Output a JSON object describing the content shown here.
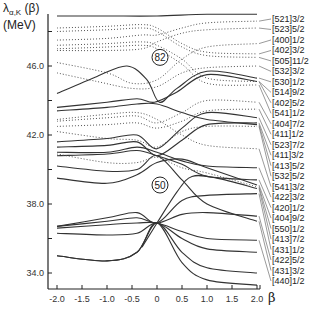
{
  "chart_data": {
    "type": "line",
    "title": "",
    "ylabel_line1_main": "λ",
    "ylabel_line1_sub": "α,K",
    "ylabel_line1_rest": " (β)",
    "ylabel_line2": "(MeV)",
    "xlabel": "β",
    "xlim": [
      -2.0,
      2.0
    ],
    "ylim": [
      33.1,
      49.0
    ],
    "x_ticks": [
      -2.0,
      -1.5,
      -1.0,
      -0.5,
      0,
      0.5,
      1.0,
      1.5,
      2.0
    ],
    "x_tick_labels": [
      "-2.0",
      "-1.5",
      "-1.0",
      "-0.5",
      "0",
      "0.5",
      "1.0",
      "1.5",
      "2.0"
    ],
    "y_ticks": [
      34.0,
      36.0,
      38.0,
      40.0,
      42.0,
      44.0,
      46.0,
      48.0
    ],
    "y_tick_labels": [
      "34.0",
      "",
      "38.0",
      "",
      "42.0",
      "",
      "46.0",
      ""
    ],
    "grid": false,
    "magic_numbers": [
      {
        "label": "82",
        "beta": 0.0,
        "energy": 46.5
      },
      {
        "label": "50",
        "beta": 0.0,
        "energy": 39.1
      }
    ],
    "state_labels": [
      "[521]3/2",
      "[523]5/2",
      "[400]1/2",
      "[402]3/2",
      "[505]11/2",
      "[532]3/2",
      "[530]1/2",
      "[514]9/2",
      "[402]5/2",
      "[541]1/2",
      "[404]7/2",
      "[411]1/2",
      "[523]7/2",
      "[411]3/2",
      "[413]5/2",
      "[532]5/2",
      "[541]3/2",
      "[422]3/2",
      "[420]1/2",
      "[404]9/2",
      "[550]1/2",
      "[413]7/2",
      "[431]1/2",
      "[422]5/2",
      "[431]3/2",
      "[440]1/2"
    ],
    "series": [
      {
        "name": "top-solid",
        "style": "solid",
        "points": [
          [
            -2,
            48.9
          ],
          [
            -1,
            48.9
          ],
          [
            0,
            48.9
          ],
          [
            1,
            49.0
          ],
          [
            2,
            49.0
          ]
        ]
      },
      {
        "name": "dot-a1",
        "style": "dotted",
        "points": [
          [
            -2,
            48.2
          ],
          [
            -1,
            48.3
          ],
          [
            -0.3,
            48.4
          ],
          [
            0,
            48.2
          ],
          [
            0.5,
            47.3
          ],
          [
            1,
            46.8
          ],
          [
            2,
            46.7
          ]
        ]
      },
      {
        "name": "dot-a2",
        "style": "dotted",
        "points": [
          [
            -2,
            48.0
          ],
          [
            -1,
            48.1
          ],
          [
            -0.3,
            48.2
          ],
          [
            0,
            48.0
          ],
          [
            0.5,
            47.1
          ],
          [
            1,
            46.6
          ],
          [
            2,
            46.5
          ]
        ]
      },
      {
        "name": "dot-a3",
        "style": "dotted",
        "points": [
          [
            -2,
            47.5
          ],
          [
            -1,
            47.6
          ],
          [
            -0.3,
            47.8
          ],
          [
            0,
            47.8
          ],
          [
            0.5,
            48.2
          ],
          [
            1,
            48.5
          ],
          [
            2,
            48.6
          ]
        ]
      },
      {
        "name": "dot-b1",
        "style": "dotted",
        "points": [
          [
            -2,
            47.2
          ],
          [
            -1,
            47.3
          ],
          [
            -0.3,
            47.4
          ],
          [
            0,
            47.2
          ],
          [
            0.5,
            46.4
          ],
          [
            1,
            45.3
          ],
          [
            2,
            45.1
          ]
        ]
      },
      {
        "name": "dot-b2",
        "style": "dotted",
        "points": [
          [
            -2,
            47.0
          ],
          [
            -1,
            47.1
          ],
          [
            -0.3,
            47.2
          ],
          [
            0,
            47.0
          ],
          [
            0.5,
            46.1
          ],
          [
            1,
            45.0
          ],
          [
            2,
            44.9
          ]
        ]
      },
      {
        "name": "dot-b3",
        "style": "dotted",
        "points": [
          [
            -2,
            46.9
          ],
          [
            -1,
            46.9
          ],
          [
            -0.3,
            47.0
          ],
          [
            0,
            47.4
          ],
          [
            0.5,
            47.9
          ],
          [
            1,
            48.1
          ],
          [
            2,
            48.2
          ]
        ]
      },
      {
        "name": "dot-c",
        "style": "dotted",
        "points": [
          [
            -2,
            46.2
          ],
          [
            -1,
            45.6
          ],
          [
            -0.5,
            45.0
          ],
          [
            0,
            45.2
          ],
          [
            0.5,
            46.4
          ],
          [
            1,
            47.1
          ],
          [
            2,
            47.3
          ]
        ]
      },
      {
        "name": "dot-d",
        "style": "dotted",
        "points": [
          [
            -2,
            45.6
          ],
          [
            -1.2,
            45.1
          ],
          [
            -0.5,
            44.7
          ],
          [
            0,
            44.8
          ],
          [
            0.5,
            45.6
          ],
          [
            1,
            45.9
          ],
          [
            2,
            46.0
          ]
        ]
      },
      {
        "name": "solid-82a",
        "style": "solid",
        "points": [
          [
            -2,
            44.4
          ],
          [
            -1.2,
            45.4
          ],
          [
            -0.6,
            46.0
          ],
          [
            -0.2,
            45.2
          ],
          [
            0.05,
            43.9
          ],
          [
            0.4,
            44.7
          ],
          [
            1,
            45.7
          ],
          [
            2,
            45.3
          ]
        ]
      },
      {
        "name": "solid-82b",
        "style": "solid",
        "points": [
          [
            -2,
            43.6
          ],
          [
            -1,
            43.9
          ],
          [
            -0.4,
            44.1
          ],
          [
            -0.05,
            43.9
          ],
          [
            0.4,
            44.5
          ],
          [
            1,
            45.5
          ],
          [
            2,
            45.1
          ]
        ]
      },
      {
        "name": "solid-82c",
        "style": "solid",
        "points": [
          [
            -2,
            43.4
          ],
          [
            -1,
            43.6
          ],
          [
            -0.4,
            43.8
          ],
          [
            0,
            43.8
          ],
          [
            0.5,
            43.3
          ],
          [
            1,
            42.9
          ],
          [
            2,
            42.6
          ]
        ]
      },
      {
        "name": "dot-e1",
        "style": "dotted",
        "points": [
          [
            -2,
            42.9
          ],
          [
            -1,
            43.2
          ],
          [
            -0.4,
            43.3
          ],
          [
            0,
            42.9
          ],
          [
            0.5,
            42.0
          ],
          [
            1,
            41.4
          ],
          [
            2,
            41.2
          ]
        ]
      },
      {
        "name": "dot-e2",
        "style": "dotted",
        "points": [
          [
            -2,
            42.8
          ],
          [
            -1,
            43.0
          ],
          [
            -0.4,
            43.1
          ],
          [
            0,
            42.7
          ],
          [
            0.5,
            43.3
          ],
          [
            1,
            44.0
          ],
          [
            2,
            43.9
          ]
        ]
      },
      {
        "name": "dot-e3",
        "style": "dotted",
        "points": [
          [
            -2,
            42.5
          ],
          [
            -1,
            42.6
          ],
          [
            -0.4,
            42.7
          ],
          [
            0,
            42.4
          ],
          [
            0.5,
            42.8
          ],
          [
            1,
            43.4
          ],
          [
            2,
            43.5
          ]
        ]
      },
      {
        "name": "dot-f",
        "style": "dotted",
        "points": [
          [
            -2,
            42.2
          ],
          [
            -1,
            41.8
          ],
          [
            -0.4,
            41.7
          ],
          [
            0,
            41.3
          ],
          [
            0.5,
            42.2
          ],
          [
            1,
            42.5
          ],
          [
            2,
            42.5
          ]
        ]
      },
      {
        "name": "solid-g1",
        "style": "solid",
        "points": [
          [
            -2,
            41.6
          ],
          [
            -1,
            41.8
          ],
          [
            -0.4,
            42.0
          ],
          [
            0,
            41.2
          ],
          [
            0.5,
            42.4
          ],
          [
            1,
            43.3
          ],
          [
            2,
            43.0
          ]
        ]
      },
      {
        "name": "solid-g2",
        "style": "solid",
        "points": [
          [
            -2,
            41.3
          ],
          [
            -1,
            41.4
          ],
          [
            -0.4,
            41.6
          ],
          [
            0,
            40.8
          ],
          [
            0.5,
            41.7
          ],
          [
            1,
            42.6
          ],
          [
            2,
            42.7
          ]
        ]
      },
      {
        "name": "solid-g3",
        "style": "solid",
        "points": [
          [
            -2,
            41.0
          ],
          [
            -1,
            41.0
          ],
          [
            -0.4,
            41.3
          ],
          [
            0,
            41.0
          ],
          [
            0.5,
            40.5
          ],
          [
            1,
            40.2
          ],
          [
            2,
            40.1
          ]
        ]
      },
      {
        "name": "solid-g4",
        "style": "solid",
        "points": [
          [
            -2,
            40.8
          ],
          [
            -1,
            40.9
          ],
          [
            -0.4,
            41.1
          ],
          [
            0,
            40.8
          ],
          [
            0.5,
            40.3
          ],
          [
            1,
            39.6
          ],
          [
            2,
            39.4
          ]
        ]
      },
      {
        "name": "dot-h",
        "style": "dotted",
        "points": [
          [
            -2,
            40.9
          ],
          [
            -1,
            40.4
          ],
          [
            -0.4,
            40.4
          ],
          [
            0,
            40.7
          ],
          [
            0.5,
            40.1
          ],
          [
            1,
            39.8
          ],
          [
            2,
            39.0
          ]
        ]
      },
      {
        "name": "solid-i",
        "style": "solid",
        "points": [
          [
            -2,
            40.2
          ],
          [
            -1,
            39.9
          ],
          [
            -0.4,
            40.0
          ],
          [
            0,
            40.8
          ],
          [
            0.5,
            39.4
          ],
          [
            1,
            38.0
          ],
          [
            2,
            37.0
          ]
        ]
      },
      {
        "name": "solid-j",
        "style": "solid",
        "points": [
          [
            -2,
            39.5
          ],
          [
            -1,
            39.2
          ],
          [
            -0.4,
            39.7
          ],
          [
            0,
            40.4
          ],
          [
            0.5,
            40.6
          ],
          [
            1,
            40.1
          ],
          [
            2,
            39.1
          ]
        ]
      },
      {
        "name": "solid-50a",
        "style": "solid",
        "points": [
          [
            -2,
            36.7
          ],
          [
            -1,
            37.2
          ],
          [
            -0.4,
            37.5
          ],
          [
            0,
            36.9
          ],
          [
            0.5,
            38.2
          ],
          [
            1,
            38.5
          ],
          [
            2,
            38.6
          ]
        ]
      },
      {
        "name": "solid-50b",
        "style": "solid",
        "points": [
          [
            -2,
            36.7
          ],
          [
            -1,
            37.0
          ],
          [
            -0.4,
            37.2
          ],
          [
            0,
            36.9
          ],
          [
            0.5,
            37.4
          ],
          [
            1,
            37.5
          ],
          [
            2,
            37.3
          ]
        ]
      },
      {
        "name": "solid-50c",
        "style": "solid",
        "points": [
          [
            -2,
            36.6
          ],
          [
            -1,
            36.8
          ],
          [
            -0.4,
            36.9
          ],
          [
            0,
            36.9
          ],
          [
            0.5,
            36.4
          ],
          [
            1,
            36.0
          ],
          [
            2,
            35.9
          ]
        ]
      },
      {
        "name": "solid-50d",
        "style": "solid",
        "points": [
          [
            -2,
            36.3
          ],
          [
            -1,
            36.2
          ],
          [
            -0.4,
            36.3
          ],
          [
            0,
            36.9
          ],
          [
            0.5,
            36.0
          ],
          [
            1,
            35.4
          ],
          [
            2,
            35.2
          ]
        ]
      },
      {
        "name": "solid-50e",
        "style": "solid",
        "points": [
          [
            -2,
            35.0
          ],
          [
            -1,
            34.7
          ],
          [
            -0.4,
            35.2
          ],
          [
            0,
            36.9
          ],
          [
            0.5,
            35.2
          ],
          [
            1,
            34.3
          ],
          [
            2,
            34.0
          ]
        ]
      },
      {
        "name": "solid-50f",
        "style": "solid",
        "points": [
          [
            -2,
            35.0
          ],
          [
            -1,
            34.7
          ],
          [
            -0.4,
            35.2
          ],
          [
            0,
            36.9
          ],
          [
            0.5,
            34.6
          ],
          [
            1,
            33.6
          ],
          [
            2,
            33.3
          ]
        ]
      },
      {
        "name": "solid-50g",
        "style": "solid",
        "points": [
          [
            -0.3,
            35.5
          ],
          [
            0,
            36.9
          ],
          [
            0.4,
            38.7
          ],
          [
            0.7,
            39.6
          ],
          [
            1.2,
            39.5
          ],
          [
            2,
            38.9
          ]
        ]
      }
    ]
  }
}
